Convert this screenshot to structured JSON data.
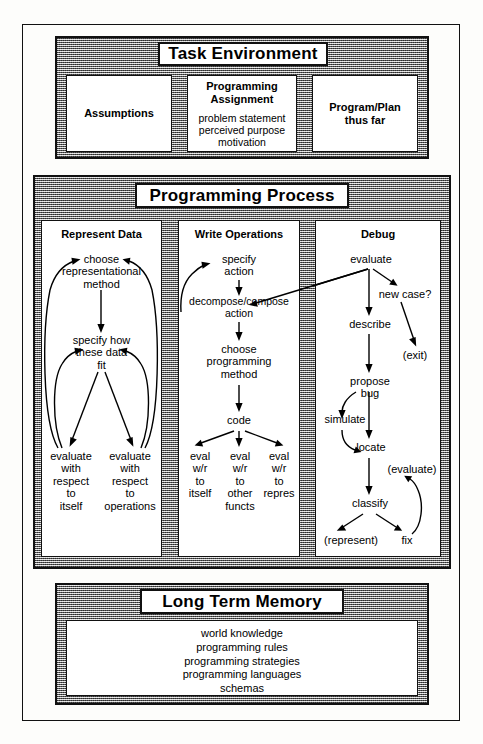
{
  "diagram": {
    "colors": {
      "ink": "#111111",
      "panel_gray": "#8e8e8e",
      "paper": "#fdfdfb",
      "box_white": "#ffffff"
    }
  },
  "task_environment": {
    "heading": "Task Environment",
    "boxes": [
      {
        "title": "Assumptions",
        "lines": ""
      },
      {
        "title": "Programming\nAssignment",
        "lines": "problem statement\nperceived purpose\nmotivation"
      },
      {
        "title": "Program/Plan\nthus far",
        "lines": ""
      }
    ]
  },
  "programming_process": {
    "heading": "Programming Process",
    "columns": [
      {
        "title": "Represent Data",
        "nodes": [
          {
            "id": "choose_rep",
            "text": "choose\nrepresentational\nmethod"
          },
          {
            "id": "specify_fit",
            "text": "specify how\nthese data\nfit"
          },
          {
            "id": "eval_itself",
            "text": "evaluate\nwith\nrespect\nto\nitself"
          },
          {
            "id": "eval_ops",
            "text": "evaluate\nwith\nrespect\nto\noperations"
          }
        ]
      },
      {
        "title": "Write Operations",
        "nodes": [
          {
            "id": "specify_action",
            "text": "specify\naction"
          },
          {
            "id": "decompose",
            "text": "decompose/compose\naction"
          },
          {
            "id": "choose_prog",
            "text": "choose\nprogramming\nmethod"
          },
          {
            "id": "code",
            "text": "code"
          },
          {
            "id": "eval_itself2",
            "text": "eval\nw/r\nto\nitself"
          },
          {
            "id": "eval_other",
            "text": "eval\nw/r\nto\nother\nfuncts"
          },
          {
            "id": "eval_repres",
            "text": "eval\nw/r\nto\nrepres"
          }
        ]
      },
      {
        "title": "Debug",
        "nodes": [
          {
            "id": "evaluate",
            "text": "evaluate"
          },
          {
            "id": "new_case",
            "text": "new case?"
          },
          {
            "id": "describe",
            "text": "describe"
          },
          {
            "id": "exit",
            "text": "(exit)"
          },
          {
            "id": "propose_bug",
            "text": "propose\nbug"
          },
          {
            "id": "simulate",
            "text": "simulate"
          },
          {
            "id": "locate",
            "text": "locate"
          },
          {
            "id": "evaluate_paren",
            "text": "(evaluate)"
          },
          {
            "id": "classify",
            "text": "classify"
          },
          {
            "id": "represent_paren",
            "text": "(represent)"
          },
          {
            "id": "fix",
            "text": "fix"
          }
        ]
      }
    ]
  },
  "long_term_memory": {
    "heading": "Long Term Memory",
    "items": [
      "world knowledge",
      "programming rules",
      "programming strategies",
      "programming languages",
      "schemas"
    ]
  }
}
